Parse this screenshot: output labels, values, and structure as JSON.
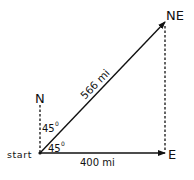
{
  "diagram": {
    "labels": {
      "north": "N",
      "northeast": "NE",
      "east": "E",
      "start": "start",
      "resultant_distance": "566 mi",
      "east_distance": "400 mi",
      "angle_from_north": "45",
      "angle_from_east": "45",
      "degree_symbol": "0"
    },
    "vectors": [
      {
        "name": "east-leg",
        "from": "start",
        "to": "E",
        "magnitude": "400 mi",
        "style": "solid-arrow"
      },
      {
        "name": "resultant",
        "from": "start",
        "to": "NE",
        "magnitude": "566 mi",
        "style": "solid-arrow"
      },
      {
        "name": "north-reference",
        "from": "start",
        "to": "N",
        "style": "dashed"
      },
      {
        "name": "north-leg",
        "from": "E",
        "to": "NE",
        "style": "dashed"
      }
    ],
    "colors": {
      "ink": "#111111",
      "background": "#ffffff"
    }
  }
}
